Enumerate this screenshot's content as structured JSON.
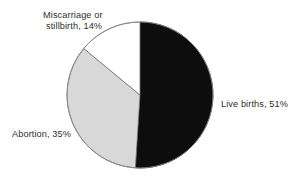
{
  "chart_data": {
    "type": "pie",
    "title": "",
    "subtitle": "",
    "xlabel": "",
    "ylabel": "",
    "legend_position": "none",
    "grid": false,
    "units": "percent",
    "start_angle_deg": 0,
    "direction": "clockwise",
    "center": {
      "x": 140,
      "y": 95
    },
    "radius": 73,
    "slices": [
      {
        "name": "Live births",
        "value": 51,
        "label": "Live births, 51%",
        "color": "#0d0d0d",
        "outline": "#0d0d0d",
        "label_position": "right"
      },
      {
        "name": "Abortion",
        "value": 35,
        "label": "Abortion, 35%",
        "color": "#d8d8d8",
        "outline": "#6f6f6f",
        "label_position": "lower-left"
      },
      {
        "name": "Miscarriage or stillbirth",
        "value": 14,
        "label": "Miscarriage or stillbirth, 14%",
        "label_line1": "Miscarriage or",
        "label_line2": "stillbirth, 14%",
        "color": "#ffffff",
        "outline": "#6f6f6f",
        "label_position": "top-left"
      }
    ],
    "categories": [
      "Live births",
      "Abortion",
      "Miscarriage or stillbirth"
    ],
    "values": [
      51,
      35,
      14
    ],
    "total": 100
  },
  "figure": {
    "background": "#ffffff",
    "text_color": "#2f2f2f"
  }
}
